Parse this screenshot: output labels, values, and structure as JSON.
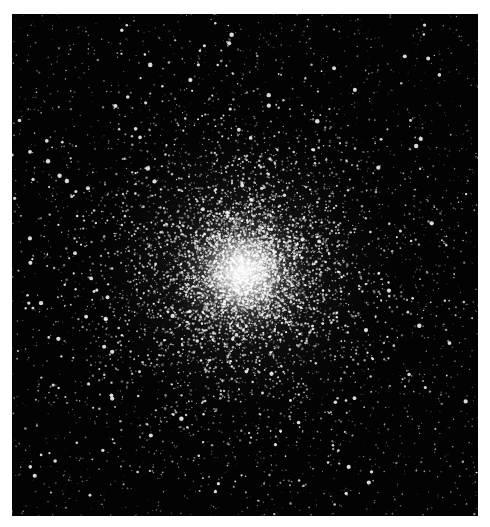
{
  "image": {
    "subject": "globular star cluster",
    "description": "Dense spherical cluster of stars with a bright white core, thinning outward into a black star field",
    "background_color": "#030303",
    "border_color": "#ffffff",
    "frame": {
      "x": 12,
      "y": 14,
      "width": 466,
      "height": 502
    },
    "core_center": {
      "x": 243,
      "y": 272
    },
    "core_color": "#ffffff",
    "star_color": "#e8e8e8"
  }
}
